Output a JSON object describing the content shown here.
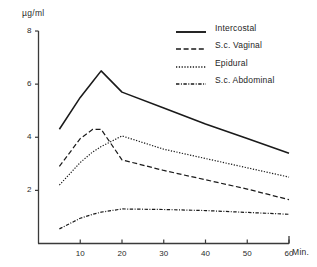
{
  "chart_data": {
    "type": "line",
    "title": "",
    "subtitle": "",
    "xlabel": "Min.",
    "ylabel": "µg/ml",
    "xlim": [
      0,
      62
    ],
    "ylim": [
      0,
      8
    ],
    "grid": false,
    "xticks": [
      10,
      20,
      30,
      40,
      50,
      60
    ],
    "yticks": [
      2,
      4,
      6,
      8
    ],
    "legend_position": "top-right",
    "x": [
      5,
      10,
      13,
      15,
      20,
      30,
      40,
      50,
      60
    ],
    "series": [
      {
        "name": "Intercostal",
        "style": "solid",
        "color": "#1a1a1a",
        "values": [
          4.3,
          5.5,
          6.1,
          6.5,
          5.7,
          5.1,
          4.5,
          3.95,
          3.4
        ]
      },
      {
        "name": "S.c. Vaginal",
        "style": "dashed",
        "color": "#1a1a1a",
        "values": [
          2.9,
          3.95,
          4.3,
          4.3,
          3.15,
          2.75,
          2.4,
          2.05,
          1.65
        ]
      },
      {
        "name": "Epidural",
        "style": "dotted",
        "color": "#1a1a1a",
        "values": [
          2.2,
          3.05,
          3.45,
          3.65,
          4.05,
          3.55,
          3.2,
          2.85,
          2.5
        ]
      },
      {
        "name": "S.c. Abdominal",
        "style": "dash-dot",
        "color": "#1a1a1a",
        "values": [
          0.55,
          0.95,
          1.1,
          1.18,
          1.3,
          1.28,
          1.24,
          1.17,
          1.1
        ]
      }
    ]
  },
  "axes": {
    "y_unit_label": "µg/ml",
    "x_unit_label": "Min.",
    "y_tick_labels": [
      "8",
      "6",
      "4",
      "2"
    ],
    "x_tick_labels": [
      "10",
      "20",
      "30",
      "40",
      "50",
      "60"
    ]
  },
  "legend": {
    "items": [
      {
        "label": "Intercostal",
        "style": "solid"
      },
      {
        "label": "S.c. Vaginal",
        "style": "dashed"
      },
      {
        "label": "Epidural",
        "style": "dotted"
      },
      {
        "label": "S.c. Abdominal",
        "style": "dash-dot"
      }
    ]
  }
}
